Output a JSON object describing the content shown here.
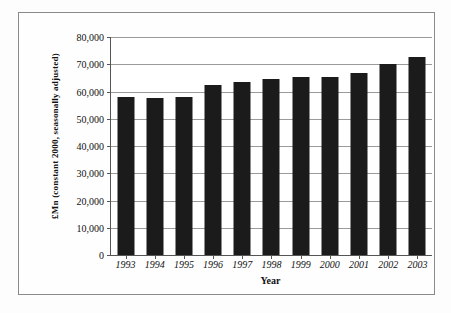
{
  "chart_data": {
    "type": "bar",
    "title": "",
    "subtitle": "",
    "xlabel": "Year",
    "ylabel": "£Mn (constant 2000, seasonally adjusted)",
    "categories": [
      "1993",
      "1994",
      "1995",
      "1996",
      "1997",
      "1998",
      "1999",
      "2000",
      "2001",
      "2002",
      "2003"
    ],
    "values": [
      58000,
      57700,
      58000,
      62400,
      63500,
      64600,
      65300,
      65300,
      66800,
      70100,
      72700
    ],
    "ylim": [
      0,
      80000
    ],
    "ytick_values": [
      0,
      10000,
      20000,
      30000,
      40000,
      50000,
      60000,
      70000,
      80000
    ],
    "ytick_labels": [
      "0",
      "10,000",
      "20,000",
      "30,000",
      "40,000",
      "50,000",
      "60,000",
      "70,000",
      "80,000"
    ],
    "grid": "horizontal",
    "legend": "none",
    "series_name": "",
    "bar_color": "#1b1b1b",
    "plot_background": "#ffffff",
    "axis_color": "#555555",
    "gridline_color": "#9a9a9a",
    "frame_color": "#8a8a8a"
  }
}
